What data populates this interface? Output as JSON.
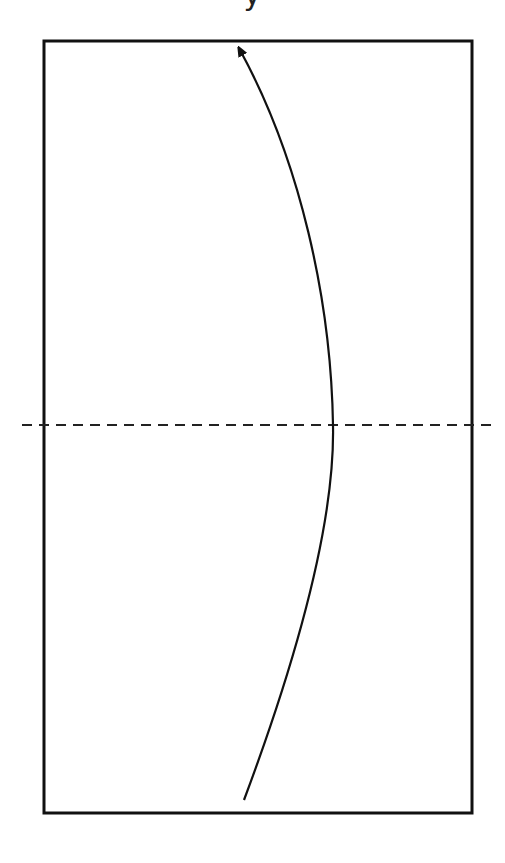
{
  "diagram": {
    "caption_fragment": "y",
    "colors": {
      "stroke": "#111111",
      "background": "#ffffff"
    },
    "rectangle": {
      "x": 44,
      "y": 41,
      "width": 428,
      "height": 772
    },
    "fold_line": {
      "style": "dashed",
      "y": 425,
      "x1": 22,
      "x2": 494
    },
    "arrow": {
      "start": [
        244,
        800
      ],
      "apex": [
        333,
        425
      ],
      "end": [
        240,
        47
      ],
      "head": "arrowhead-at-end"
    }
  }
}
